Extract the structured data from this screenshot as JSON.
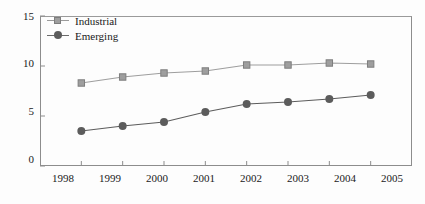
{
  "chart_data": {
    "type": "line",
    "title": "",
    "xlabel": "",
    "ylabel": "",
    "categories": [
      "1998",
      "1999",
      "2000",
      "2001",
      "2002",
      "2003",
      "2004",
      "2005"
    ],
    "series": [
      {
        "name": "Industrial",
        "marker": "square",
        "color": "#9e9e9e",
        "values": [
          8.3,
          8.9,
          9.3,
          9.5,
          10.1,
          10.1,
          10.3,
          10.2
        ]
      },
      {
        "name": "Emerging",
        "marker": "circle",
        "color": "#5c5c5c",
        "values": [
          3.5,
          4.0,
          4.4,
          5.4,
          6.2,
          6.4,
          6.7,
          7.1
        ]
      }
    ],
    "ylim": [
      0,
      15
    ],
    "yticks": [
      0,
      5,
      10,
      15
    ],
    "ytick_labels": [
      "0",
      "5",
      "10",
      "15"
    ],
    "xticks": [
      "1998",
      "1999",
      "2000",
      "2001",
      "2002",
      "2003",
      "2004",
      "2005"
    ],
    "grid": false,
    "legend_position": "top-left",
    "legend_entries": [
      "Industrial",
      "Emerging"
    ]
  },
  "axes": {
    "y_labels": [
      "15",
      "10",
      "5",
      "0"
    ],
    "x_labels": [
      "1998",
      "1999",
      "2000",
      "2001",
      "2002",
      "2003",
      "2004",
      "2005"
    ]
  },
  "legend": {
    "items": [
      {
        "label": "Industrial",
        "marker": "square-marker",
        "color": "#9e9e9e"
      },
      {
        "label": "Emerging",
        "marker": "circle-marker",
        "color": "#5c5c5c"
      }
    ]
  },
  "colors": {
    "industrial": "#9e9e9e",
    "emerging": "#5c5c5c",
    "axis": "#8d8d8d",
    "text": "#1a1a1a",
    "background": "#fdfdfd"
  }
}
